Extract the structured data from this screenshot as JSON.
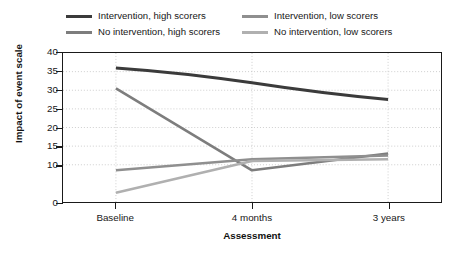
{
  "chart_data": {
    "type": "line",
    "title": "",
    "xlabel": "Assessment",
    "ylabel": "Impact of event scale",
    "categories": [
      "Baseline",
      "4 months",
      "3 years"
    ],
    "ylim": [
      0,
      40
    ],
    "yticks": [
      0,
      10,
      15,
      20,
      25,
      30,
      35,
      40
    ],
    "ytick_labels": [
      "0",
      "10",
      "15",
      "20",
      "25",
      "30",
      "35",
      "40"
    ],
    "grid": "dotted-both-axes",
    "legend_position": "above-plot",
    "series": [
      {
        "name": "Intervention, high scorers",
        "values": [
          36,
          32,
          27.5
        ],
        "color": "#3b3b3b"
      },
      {
        "name": "No intervention, high scorers",
        "values": [
          30.5,
          8.5,
          13
        ],
        "color": "#7d7d7d"
      },
      {
        "name": "Intervention, low scorers",
        "values": [
          8.5,
          11.5,
          12.5
        ],
        "color": "#8f8f8f"
      },
      {
        "name": "No intervention, low scorers",
        "values": [
          2.5,
          11,
          11.5
        ],
        "color": "#b0b0b0"
      }
    ]
  },
  "legend": {
    "entries": [
      {
        "label": "Intervention, high scorers"
      },
      {
        "label": "Intervention, low scorers"
      },
      {
        "label": "No intervention, high scorers"
      },
      {
        "label": "No intervention, low scorers"
      }
    ]
  },
  "axes": {
    "y_title": "Impact of event scale",
    "x_title": "Assessment"
  },
  "colors": {
    "axis": "#1a1a1a",
    "grid": "#c9c9c9",
    "background": "#ffffff",
    "text": "#171717"
  }
}
